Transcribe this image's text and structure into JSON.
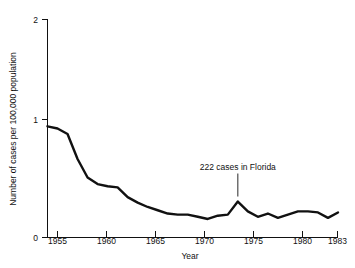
{
  "chart_data": {
    "type": "line",
    "title": "",
    "xlabel": "Year",
    "ylabel": "Number of cases per 100,000 population",
    "xlim": [
      1954,
      1983
    ],
    "ylim": [
      0,
      2
    ],
    "grid": false,
    "legend": null,
    "x_ticks": [
      "1955",
      "1960",
      "1965",
      "1970",
      "1975",
      "1980",
      "1983"
    ],
    "x_tick_values": [
      1955,
      1960,
      1965,
      1970,
      1975,
      1980,
      1983
    ],
    "y_ticks": [
      "0",
      "1",
      "2"
    ],
    "y_tick_values": [
      0,
      1,
      2
    ],
    "series": [
      {
        "name": "Reported cases per 100,000 population",
        "color": "#111111",
        "x": [
          1954,
          1955,
          1956,
          1957,
          1958,
          1959,
          1960,
          1961,
          1962,
          1963,
          1964,
          1965,
          1966,
          1967,
          1968,
          1969,
          1970,
          1971,
          1972,
          1973,
          1974,
          1975,
          1976,
          1977,
          1978,
          1979,
          1980,
          1981,
          1982,
          1983
        ],
        "values": [
          1.02,
          1.0,
          0.95,
          0.72,
          0.55,
          0.49,
          0.47,
          0.46,
          0.37,
          0.32,
          0.28,
          0.25,
          0.22,
          0.21,
          0.21,
          0.19,
          0.17,
          0.2,
          0.21,
          0.33,
          0.24,
          0.19,
          0.22,
          0.18,
          0.21,
          0.24,
          0.24,
          0.23,
          0.18,
          0.23
        ]
      }
    ],
    "annotations": [
      {
        "text": "222 cases in Florida",
        "points_to_year": 1973,
        "points_to_value": 0.33
      }
    ]
  },
  "axis": {
    "y_title": "Number of cases per 100,000 population",
    "x_title": "Year"
  }
}
